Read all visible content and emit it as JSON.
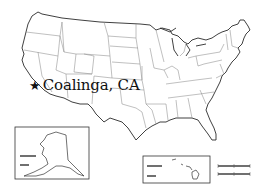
{
  "map": {
    "title": "United States outline map",
    "marker": {
      "icon": "star-icon",
      "glyph": "★",
      "label": "Coalinga, CA"
    },
    "insets": [
      {
        "name": "Alaska"
      },
      {
        "name": "Hawaii"
      }
    ],
    "scale_bars": [
      {
        "name": "miles-scale"
      },
      {
        "name": "kilometers-scale"
      }
    ],
    "colors": {
      "background": "#ffffff",
      "outline": "#2a2a2a",
      "state_border": "#8c8c8c",
      "text": "#111111"
    }
  }
}
